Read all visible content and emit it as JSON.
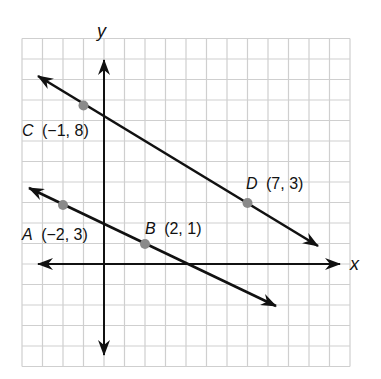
{
  "diagram": {
    "type": "coordinate-plane",
    "axes": {
      "x_label": "x",
      "y_label": "y"
    },
    "grid": {
      "x_min": -4,
      "x_max": 12,
      "y_min": -5,
      "y_max": 11,
      "step": 1,
      "show": true
    },
    "points": [
      {
        "name": "C",
        "coords": "(−1, 8)",
        "x": -1,
        "y": 8
      },
      {
        "name": "D",
        "coords": "(7, 3)",
        "x": 7,
        "y": 3
      },
      {
        "name": "A",
        "coords": "(−2, 3)",
        "x": -2,
        "y": 3
      },
      {
        "name": "B",
        "coords": "(2, 1)",
        "x": 2,
        "y": 1
      }
    ],
    "lines": [
      {
        "name": "line-CD",
        "through": [
          "C",
          "D"
        ]
      },
      {
        "name": "line-AB",
        "through": [
          "A",
          "B"
        ]
      }
    ],
    "colors": {
      "grid": "#cfcfcf",
      "line": "#111111",
      "point": "#8a8a8a"
    }
  }
}
